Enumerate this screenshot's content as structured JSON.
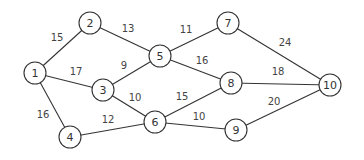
{
  "graph": {
    "nodes": [
      {
        "id": "1",
        "x": 35,
        "y": 73
      },
      {
        "id": "2",
        "x": 90,
        "y": 23
      },
      {
        "id": "3",
        "x": 103,
        "y": 90
      },
      {
        "id": "4",
        "x": 70,
        "y": 137
      },
      {
        "id": "5",
        "x": 160,
        "y": 56
      },
      {
        "id": "6",
        "x": 155,
        "y": 122
      },
      {
        "id": "7",
        "x": 228,
        "y": 23
      },
      {
        "id": "8",
        "x": 231,
        "y": 83
      },
      {
        "id": "9",
        "x": 236,
        "y": 130
      },
      {
        "id": "10",
        "x": 330,
        "y": 85
      }
    ],
    "edges": [
      {
        "from": "1",
        "to": "2",
        "weight": "15",
        "lx": 57,
        "ly": 37
      },
      {
        "from": "1",
        "to": "3",
        "weight": "17",
        "lx": 76,
        "ly": 71
      },
      {
        "from": "1",
        "to": "4",
        "weight": "16",
        "lx": 43,
        "ly": 114
      },
      {
        "from": "2",
        "to": "5",
        "weight": "13",
        "lx": 128,
        "ly": 28
      },
      {
        "from": "3",
        "to": "5",
        "weight": "9",
        "lx": 124,
        "ly": 65
      },
      {
        "from": "3",
        "to": "6",
        "weight": "10",
        "lx": 135,
        "ly": 97
      },
      {
        "from": "4",
        "to": "6",
        "weight": "12",
        "lx": 108,
        "ly": 119
      },
      {
        "from": "5",
        "to": "7",
        "weight": "11",
        "lx": 186,
        "ly": 29
      },
      {
        "from": "5",
        "to": "8",
        "weight": "16",
        "lx": 202,
        "ly": 60
      },
      {
        "from": "6",
        "to": "8",
        "weight": "15",
        "lx": 182,
        "ly": 96
      },
      {
        "from": "6",
        "to": "9",
        "weight": "10",
        "lx": 199,
        "ly": 116
      },
      {
        "from": "7",
        "to": "10",
        "weight": "24",
        "lx": 285,
        "ly": 42
      },
      {
        "from": "8",
        "to": "10",
        "weight": "18",
        "lx": 278,
        "ly": 71
      },
      {
        "from": "9",
        "to": "10",
        "weight": "20",
        "lx": 274,
        "ly": 101
      }
    ]
  }
}
